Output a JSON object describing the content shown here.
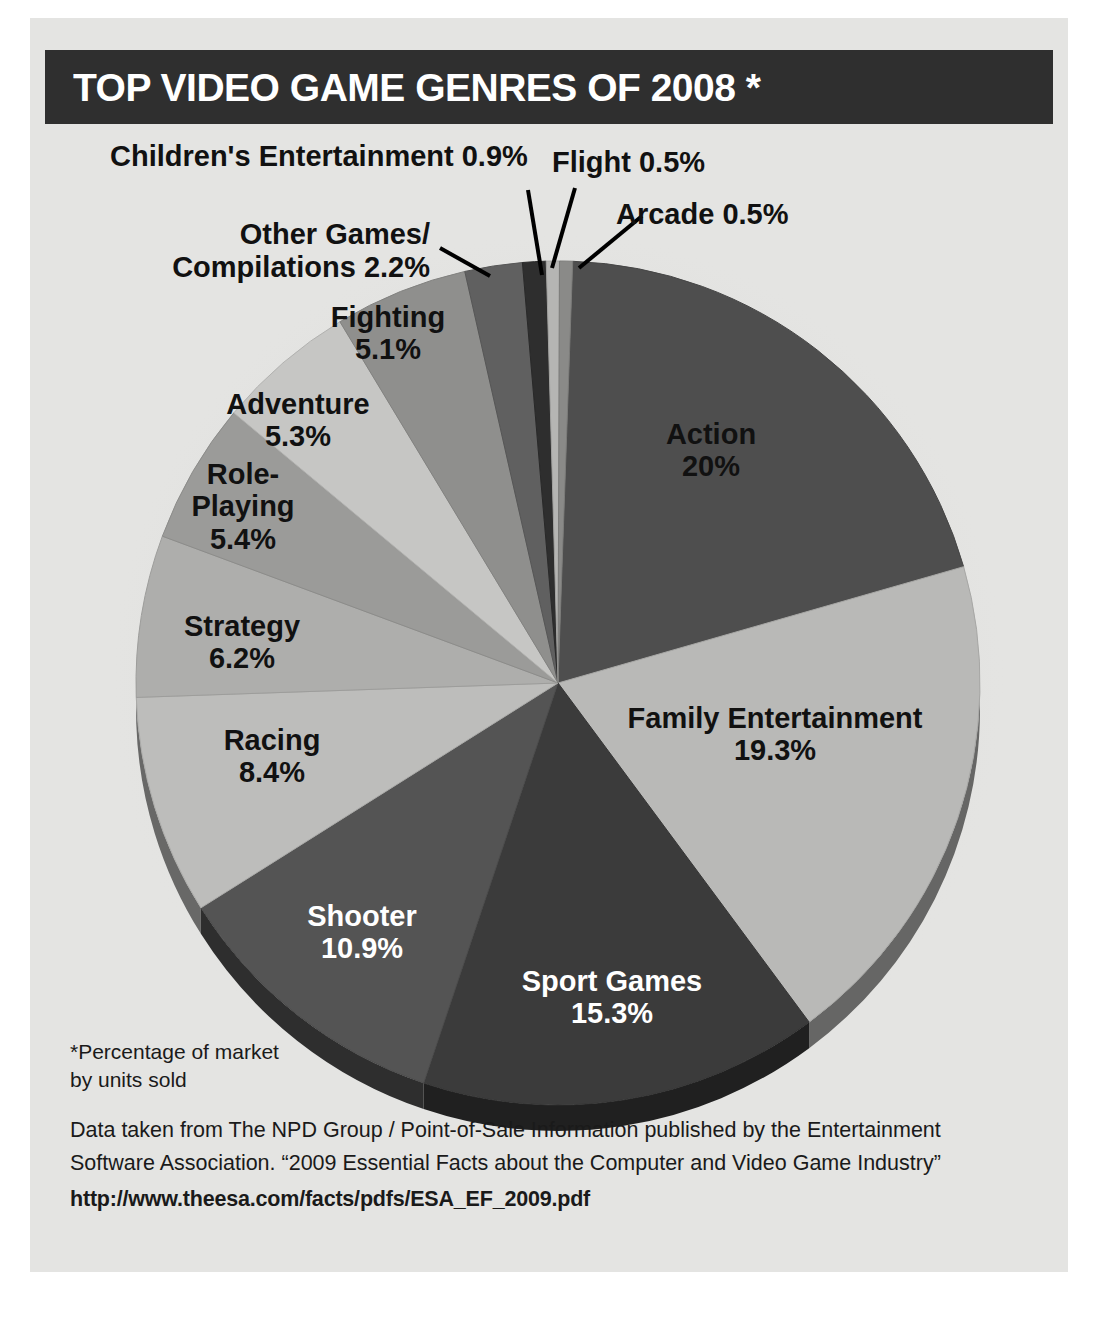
{
  "header": {
    "title": "TOP VIDEO GAME GENRES OF 2008 *",
    "bar_color": "#2f2f2f",
    "text_color": "#ffffff"
  },
  "page": {
    "background": "#e4e4e2"
  },
  "footnote": {
    "text": "*Percentage of market\n by units sold"
  },
  "source": {
    "line1": "Data taken from The NPD Group / Point-of-Sale Information published by the Entertainment",
    "line2": "Software Association. “2009 Essential Facts about the Computer and Video Game Industry”",
    "url": "http://www.theesa.com/facts/pdfs/ESA_EF_2009.pdf"
  },
  "chart_data": {
    "type": "pie",
    "title": "TOP VIDEO GAME GENRES OF 2008 *",
    "units": "percent of market by units sold",
    "total": 100,
    "legend": "none (direct labels)",
    "categories": [
      "Action",
      "Family Entertainment",
      "Sport Games",
      "Shooter",
      "Racing",
      "Strategy",
      "Role-Playing",
      "Adventure",
      "Fighting",
      "Other Games/Compilations",
      "Children's Entertainment",
      "Flight",
      "Arcade"
    ],
    "values": [
      20,
      19.3,
      15.3,
      10.9,
      8.4,
      6.2,
      5.4,
      5.3,
      5.1,
      2.2,
      0.9,
      0.5,
      0.5
    ],
    "slices": [
      {
        "name": "Action",
        "label": "Action",
        "value_label": "20%",
        "value": 20,
        "color": "#4e4e4e",
        "text_color": "#ffffff",
        "label_placement": "inside"
      },
      {
        "name": "Family Entertainment",
        "label": "Family Entertainment",
        "value_label": "19.3%",
        "value": 19.3,
        "color": "#b9b9b7",
        "text_color": "#111111",
        "label_placement": "inside"
      },
      {
        "name": "Sport Games",
        "label": "Sport Games",
        "value_label": "15.3%",
        "value": 15.3,
        "color": "#3b3b3b",
        "text_color": "#ffffff",
        "label_placement": "inside"
      },
      {
        "name": "Shooter",
        "label": "Shooter",
        "value_label": "10.9%",
        "value": 10.9,
        "color": "#545454",
        "text_color": "#ffffff",
        "label_placement": "inside"
      },
      {
        "name": "Racing",
        "label": "Racing",
        "value_label": "8.4%",
        "value": 8.4,
        "color": "#bdbdbb",
        "text_color": "#111111",
        "label_placement": "inside"
      },
      {
        "name": "Strategy",
        "label": "Strategy",
        "value_label": "6.2%",
        "value": 6.2,
        "color": "#aeaeac",
        "text_color": "#111111",
        "label_placement": "inside"
      },
      {
        "name": "Role-Playing",
        "label": "Role-\nPlaying",
        "value_label": "5.4%",
        "value": 5.4,
        "color": "#9b9b99",
        "text_color": "#111111",
        "label_placement": "inside"
      },
      {
        "name": "Adventure",
        "label": "Adventure",
        "value_label": "5.3%",
        "value": 5.3,
        "color": "#c6c6c4",
        "text_color": "#111111",
        "label_placement": "inside"
      },
      {
        "name": "Fighting",
        "label": "Fighting",
        "value_label": "5.1%",
        "value": 5.1,
        "color": "#8f8f8d",
        "text_color": "#111111",
        "label_placement": "inside"
      },
      {
        "name": "Other Games/Compilations",
        "label": "Other Games/\nCompilations",
        "value_label": "2.2%",
        "value": 2.2,
        "color": "#606060",
        "text_color": "#111111",
        "label_placement": "outside-left"
      },
      {
        "name": "Children's Entertainment",
        "label": "Children's Entertainment",
        "value_label": "0.9%",
        "value": 0.9,
        "color": "#2e2e2e",
        "text_color": "#111111",
        "label_placement": "outside-top"
      },
      {
        "name": "Flight",
        "label": "Flight",
        "value_label": "0.5%",
        "value": 0.5,
        "color": "#b5b5b3",
        "text_color": "#111111",
        "label_placement": "outside-top"
      },
      {
        "name": "Arcade",
        "label": "Arcade",
        "value_label": "0.5%",
        "value": 0.5,
        "color": "#8a8a88",
        "text_color": "#111111",
        "label_placement": "outside-right"
      }
    ]
  }
}
